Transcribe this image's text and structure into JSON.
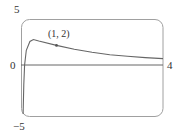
{
  "chart_data": {
    "type": "line",
    "title": "",
    "xlabel": "",
    "ylabel": "",
    "xlim": [
      0,
      4
    ],
    "ylim": [
      -5,
      5
    ],
    "grid": false,
    "legend": null,
    "tick_labels": {
      "y_top": "5",
      "y_bottom": "−5",
      "x_left": "0",
      "x_right": "4"
    },
    "series": [
      {
        "name": "f(x)",
        "x": [
          0.06,
          0.08,
          0.1,
          0.15,
          0.25,
          0.35,
          0.5,
          1.0,
          1.5,
          2.0,
          2.5,
          3.0,
          3.5,
          4.0
        ],
        "y": [
          -5,
          -2,
          0,
          1.5,
          2.4,
          2.6,
          2.45,
          2.0,
          1.6,
          1.3,
          1.05,
          0.9,
          0.75,
          0.65
        ]
      }
    ],
    "annotations": [
      {
        "text": "(1, 2)",
        "x": 1,
        "y": 2,
        "marker": "dot"
      }
    ]
  },
  "colors": {
    "curve": "#666666",
    "frame": "#9a9a9a",
    "axis": "#666666",
    "text": "#333333"
  }
}
